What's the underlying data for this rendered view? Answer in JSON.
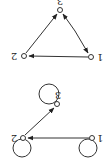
{
  "orientation": "rotated-180",
  "graphs": [
    {
      "name": "triangle-graph",
      "nodes": [
        {
          "id": "3",
          "label": "3",
          "x": 60,
          "y": 10
        },
        {
          "id": "2",
          "label": "2",
          "x": 24,
          "y": 56
        },
        {
          "id": "1",
          "label": "1",
          "x": 91,
          "y": 57
        }
      ],
      "edges": [
        {
          "from": "1",
          "to": "2"
        },
        {
          "from": "2",
          "to": "3"
        },
        {
          "from": "1",
          "to": "3"
        },
        {
          "from": "3",
          "to": "1"
        }
      ]
    },
    {
      "name": "loop-graph",
      "nodes": [
        {
          "id": "3",
          "label": "3",
          "x": 57,
          "y": 104,
          "self_loop": true
        },
        {
          "id": "2",
          "label": "2",
          "x": 23,
          "y": 138,
          "self_loop": true
        },
        {
          "id": "1",
          "label": "1",
          "x": 92,
          "y": 138,
          "self_loop": true
        }
      ],
      "edges": [
        {
          "from": "1",
          "to": "2"
        },
        {
          "from": "2",
          "to": "3"
        }
      ]
    }
  ],
  "labels": {
    "g1_n1": "1",
    "g1_n2": "2",
    "g1_n3": "3",
    "g2_n1": "1",
    "g2_n2": "2",
    "g2_n3": "3"
  }
}
